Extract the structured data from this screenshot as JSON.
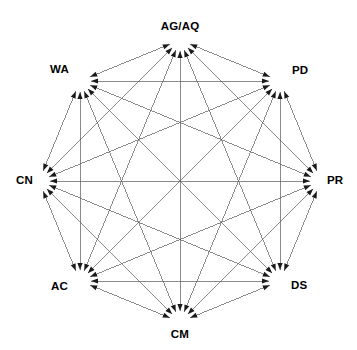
{
  "diagram": {
    "type": "complete-directed-graph",
    "title": "",
    "node_count": 8,
    "edge_style": "bidirectional-arrow",
    "colors": {
      "background": "#ffffff",
      "line": "#5a5a5a",
      "arrow": "#1a1a1a",
      "label": "#000000"
    },
    "geometry": {
      "center_x": 180,
      "center_y": 181,
      "radius": 141,
      "start_angle_deg": -90
    },
    "nodes": [
      {
        "id": "AGAQ",
        "label": "AG/AQ",
        "angle_deg": -90,
        "x": 180,
        "y": 40,
        "label_x": 180,
        "label_y": 21,
        "label_anchor": "center"
      },
      {
        "id": "PD",
        "label": "PD",
        "angle_deg": -45,
        "x": 280,
        "y": 81,
        "label_x": 292,
        "label_y": 65,
        "label_anchor": "left"
      },
      {
        "id": "PR",
        "label": "PR",
        "angle_deg": 0,
        "x": 321,
        "y": 181,
        "label_x": 327,
        "label_y": 175,
        "label_anchor": "left"
      },
      {
        "id": "DS",
        "label": "DS",
        "angle_deg": 45,
        "x": 280,
        "y": 281,
        "label_x": 291,
        "label_y": 280,
        "label_anchor": "left"
      },
      {
        "id": "CM",
        "label": "CM",
        "angle_deg": 90,
        "x": 180,
        "y": 322,
        "label_x": 180,
        "label_y": 329,
        "label_anchor": "center"
      },
      {
        "id": "AC",
        "label": "AC",
        "angle_deg": 135,
        "x": 80,
        "y": 281,
        "label_x": 68,
        "label_y": 281,
        "label_anchor": "right"
      },
      {
        "id": "CN",
        "label": "CN",
        "angle_deg": 180,
        "x": 39,
        "y": 181,
        "label_x": 33,
        "label_y": 175,
        "label_anchor": "right"
      },
      {
        "id": "WA",
        "label": "WA",
        "angle_deg": -135,
        "x": 80,
        "y": 81,
        "label_x": 69,
        "label_y": 64,
        "label_anchor": "right"
      }
    ],
    "edges": [
      {
        "from": "AGAQ",
        "to": "PD",
        "bidirectional": true
      },
      {
        "from": "AGAQ",
        "to": "PR",
        "bidirectional": true
      },
      {
        "from": "AGAQ",
        "to": "DS",
        "bidirectional": true
      },
      {
        "from": "AGAQ",
        "to": "CM",
        "bidirectional": true
      },
      {
        "from": "AGAQ",
        "to": "AC",
        "bidirectional": true
      },
      {
        "from": "AGAQ",
        "to": "CN",
        "bidirectional": true
      },
      {
        "from": "AGAQ",
        "to": "WA",
        "bidirectional": true
      },
      {
        "from": "PD",
        "to": "PR",
        "bidirectional": true
      },
      {
        "from": "PD",
        "to": "DS",
        "bidirectional": true
      },
      {
        "from": "PD",
        "to": "CM",
        "bidirectional": true
      },
      {
        "from": "PD",
        "to": "AC",
        "bidirectional": true
      },
      {
        "from": "PD",
        "to": "CN",
        "bidirectional": true
      },
      {
        "from": "PD",
        "to": "WA",
        "bidirectional": true
      },
      {
        "from": "PR",
        "to": "DS",
        "bidirectional": true
      },
      {
        "from": "PR",
        "to": "CM",
        "bidirectional": true
      },
      {
        "from": "PR",
        "to": "AC",
        "bidirectional": true
      },
      {
        "from": "PR",
        "to": "CN",
        "bidirectional": true
      },
      {
        "from": "PR",
        "to": "WA",
        "bidirectional": true
      },
      {
        "from": "DS",
        "to": "CM",
        "bidirectional": true
      },
      {
        "from": "DS",
        "to": "AC",
        "bidirectional": true
      },
      {
        "from": "DS",
        "to": "CN",
        "bidirectional": true
      },
      {
        "from": "DS",
        "to": "WA",
        "bidirectional": true
      },
      {
        "from": "CM",
        "to": "AC",
        "bidirectional": true
      },
      {
        "from": "CM",
        "to": "CN",
        "bidirectional": true
      },
      {
        "from": "CM",
        "to": "WA",
        "bidirectional": true
      },
      {
        "from": "AC",
        "to": "CN",
        "bidirectional": true
      },
      {
        "from": "AC",
        "to": "WA",
        "bidirectional": true
      },
      {
        "from": "CN",
        "to": "WA",
        "bidirectional": true
      }
    ]
  }
}
